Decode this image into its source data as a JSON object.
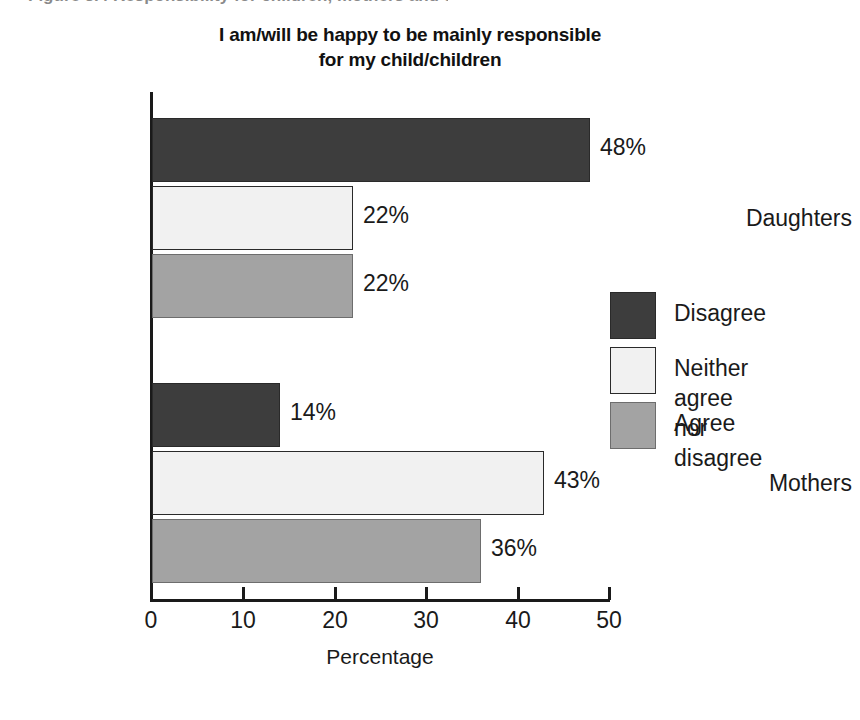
{
  "scan_artifact": {
    "clipped_line_text": "Figure 3.4 Responsibility for children, mothers and daughters"
  },
  "chart_data": {
    "type": "bar",
    "orientation": "horizontal",
    "title": "I am/will be happy to be mainly responsible for my child/children",
    "title_lines": [
      "I am/will be happy to be mainly responsible",
      "for my child/children"
    ],
    "xlabel": "Percentage",
    "ylabel": "",
    "xlim": [
      0,
      50
    ],
    "xticks": [
      0,
      10,
      20,
      30,
      40,
      50
    ],
    "xtick_labels": [
      "0",
      "10",
      "20",
      "30",
      "40",
      "50"
    ],
    "grid": false,
    "legend_position": "right",
    "categories": [
      "Daughters",
      "Mothers"
    ],
    "series": [
      {
        "name": "Disagree",
        "color": "#3d3d3d",
        "values": [
          48,
          14
        ],
        "value_labels": [
          "48%",
          "14%"
        ]
      },
      {
        "name": "Neither agree nor disagree",
        "name_lines": [
          "Neither agree",
          "nor disagree"
        ],
        "color": "#f1f1f1",
        "values": [
          22,
          43
        ],
        "value_labels": [
          "22%",
          "43%"
        ]
      },
      {
        "name": "Agree",
        "color": "#a3a3a3",
        "values": [
          22,
          36
        ],
        "value_labels": [
          "22%",
          "36%"
        ]
      }
    ]
  },
  "bars": [
    {
      "group": "Daughters",
      "series": "Disagree",
      "value": 48,
      "label": "48%",
      "style": "s-disagree",
      "top": 118,
      "height": 64,
      "width": 438
    },
    {
      "group": "Daughters",
      "series": "Neither agree nor disagree",
      "value": 22,
      "label": "22%",
      "style": "s-neither",
      "top": 186,
      "height": 64,
      "width": 201
    },
    {
      "group": "Daughters",
      "series": "Agree",
      "value": 22,
      "label": "22%",
      "style": "s-agree",
      "top": 254,
      "height": 64,
      "width": 201
    },
    {
      "group": "Mothers",
      "series": "Disagree",
      "value": 14,
      "label": "14%",
      "style": "s-disagree",
      "top": 383,
      "height": 64,
      "width": 128
    },
    {
      "group": "Mothers",
      "series": "Neither agree nor disagree",
      "value": 43,
      "label": "43%",
      "style": "s-neither",
      "top": 451,
      "height": 64,
      "width": 392
    },
    {
      "group": "Mothers",
      "series": "Agree",
      "value": 36,
      "label": "36%",
      "style": "s-agree",
      "top": 519,
      "height": 64,
      "width": 329
    }
  ],
  "category_labels": [
    {
      "text": "Daughters",
      "top": 205
    },
    {
      "text": "Mothers",
      "top": 470
    }
  ],
  "ticks": [
    {
      "label": "0",
      "x": 150
    },
    {
      "label": "10",
      "x": 242
    },
    {
      "label": "20",
      "x": 334
    },
    {
      "label": "30",
      "x": 425
    },
    {
      "label": "40",
      "x": 517
    },
    {
      "label": "50",
      "x": 608
    }
  ],
  "legend": {
    "items": [
      {
        "label": "Disagree",
        "style": "s-disagree",
        "top": 0
      },
      {
        "label": "Neither agree\nnor disagree",
        "style": "s-neither",
        "top": 55
      },
      {
        "label": "Agree",
        "style": "s-agree",
        "top": 110
      }
    ]
  }
}
